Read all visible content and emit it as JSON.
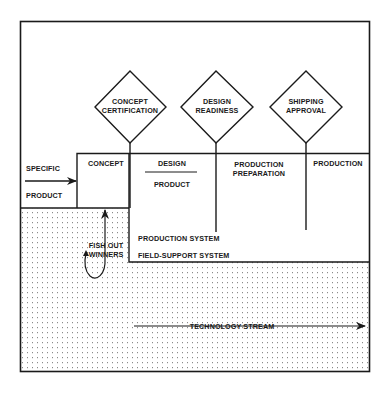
{
  "diagram": {
    "gates": [
      {
        "line1": "CONCEPT",
        "line2": "CERTIFICATION"
      },
      {
        "line1": "DESIGN",
        "line2": "READINESS"
      },
      {
        "line1": "SHIPPING",
        "line2": "APPROVAL"
      }
    ],
    "input": {
      "top": "SPECIFIC",
      "bottom": "PRODUCT"
    },
    "stages": {
      "concept": "CONCEPT",
      "design_top": "DESIGN",
      "design_bottom": "PRODUCT",
      "prep_line1": "PRODUCTION",
      "prep_line2": "PREPARATION",
      "production": "PRODUCTION"
    },
    "systems": {
      "production_system": "PRODUCTION SYSTEM",
      "field_support_system": "FIELD-SUPPORT SYSTEM"
    },
    "feedback": {
      "line1": "FISH OUT",
      "line2": "WINNERS"
    },
    "stream": {
      "label": "TECHNOLOGY STREAM"
    },
    "colors": {
      "line": "#1a1a1a",
      "dot": "#8a8a8a",
      "background": "#ffffff"
    }
  }
}
